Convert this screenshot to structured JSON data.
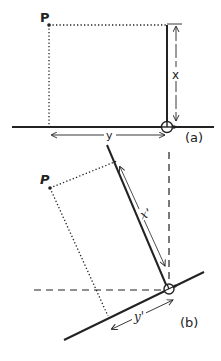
{
  "diagram": {
    "panel_a": {
      "point_label": "P",
      "x_label": "x",
      "y_label": "y",
      "caption": "(a)"
    },
    "panel_b": {
      "point_label": "P",
      "x_label": "x'",
      "y_label": "y'",
      "caption": "(b)"
    },
    "colors": {
      "ink": "#222222",
      "background": "#ffffff"
    }
  }
}
